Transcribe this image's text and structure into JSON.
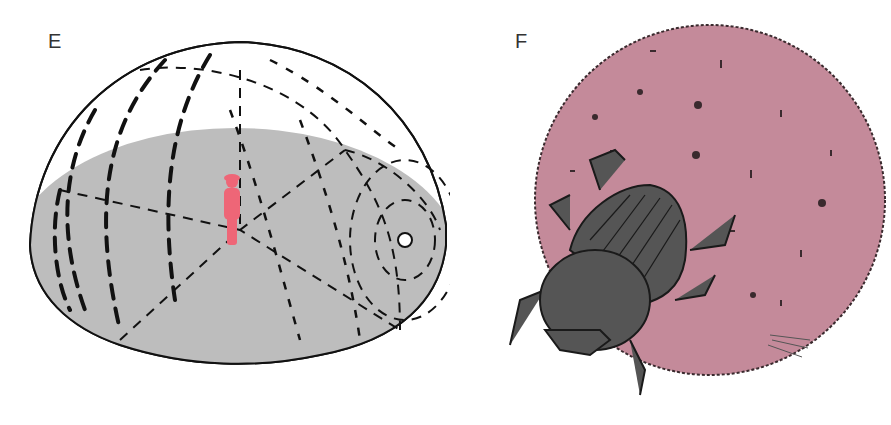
{
  "panels": [
    {
      "label": "E",
      "description": "Hemispherical dome (planetarium-like sky) with dashed star-trail lines, shaded gray ground disc, small red human figure standing at center, small white circle (celestial pole) on right edge",
      "colors": {
        "dome_fill": "#ffffff",
        "ground_fill": "#bdbdbd",
        "line": "#111111",
        "figure": "#ee6677",
        "pole": "#ffffff"
      }
    },
    {
      "label": "F",
      "description": "Dung beetle pushing a large pink dung ball with textured speckles",
      "colors": {
        "ball_fill": "#c48a9a",
        "ball_outline": "#3a2a2e",
        "beetle_fill": "#555555",
        "beetle_outline": "#1a1a1a"
      }
    }
  ]
}
